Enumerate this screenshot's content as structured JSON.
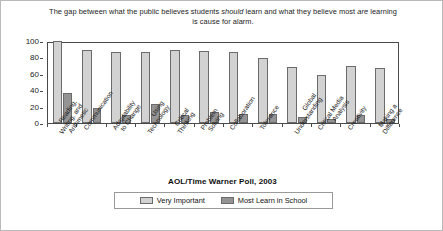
{
  "chart_data": {
    "type": "bar",
    "title": "The gap between what the public believes students should learn and what they believe most are  learning is cause for alarm.",
    "title_line1_pre": "The gap between what the public believes students ",
    "title_line1_em": "should",
    "title_line1_post": " learn and what they believe",
    "title_line2_pre": "most ",
    "title_line2_em": "are",
    "title_line2_post": "  learning is cause for alarm.",
    "source": "AOL/Time Warner Poll, 2003",
    "xlabel": "",
    "ylabel": "",
    "ylim": [
      0,
      100
    ],
    "yticks": [
      0,
      20,
      40,
      60,
      80,
      100
    ],
    "ytick_labels": [
      "0",
      "20",
      "40",
      "60",
      "80",
      "100"
    ],
    "grid": false,
    "legend_position": "bottom",
    "categories": [
      "Reading, Writing, and Arithmetic",
      "Communication",
      "Adaptability to Change",
      "Using Technology",
      "Critical Thinking",
      "Problem Solving",
      "Collaboration",
      "Tolerance",
      "Global Understanding",
      "Critical Media Analysis",
      "Creativity",
      "Making a Difference"
    ],
    "category_lines": [
      [
        "Reading,",
        "Writing, and",
        "Arithmetic"
      ],
      [
        "Communication"
      ],
      [
        "Adaptability",
        "to Change"
      ],
      [
        "Using",
        "Technology"
      ],
      [
        "Critical",
        "Thinking"
      ],
      [
        "Problem",
        "Solving"
      ],
      [
        "Collaboration"
      ],
      [
        "Tolerance"
      ],
      [
        "Global",
        "Understanding"
      ],
      [
        "Critical Media",
        "Analysis"
      ],
      [
        "Creativity"
      ],
      [
        "Making a",
        "Difference"
      ]
    ],
    "series": [
      {
        "name": "Very Important",
        "color": "#d2d2d2",
        "values": [
          100,
          89,
          87,
          87,
          89,
          88,
          86,
          79,
          68,
          59,
          70,
          67
        ]
      },
      {
        "name": "Most Learn in School",
        "color": "#949494",
        "values": [
          37,
          18,
          10,
          23,
          10,
          13,
          11,
          11,
          7,
          5,
          10,
          5
        ]
      }
    ]
  },
  "legend": {
    "entries": [
      {
        "label": "Very Important"
      },
      {
        "label": "Most Learn in School"
      }
    ]
  }
}
